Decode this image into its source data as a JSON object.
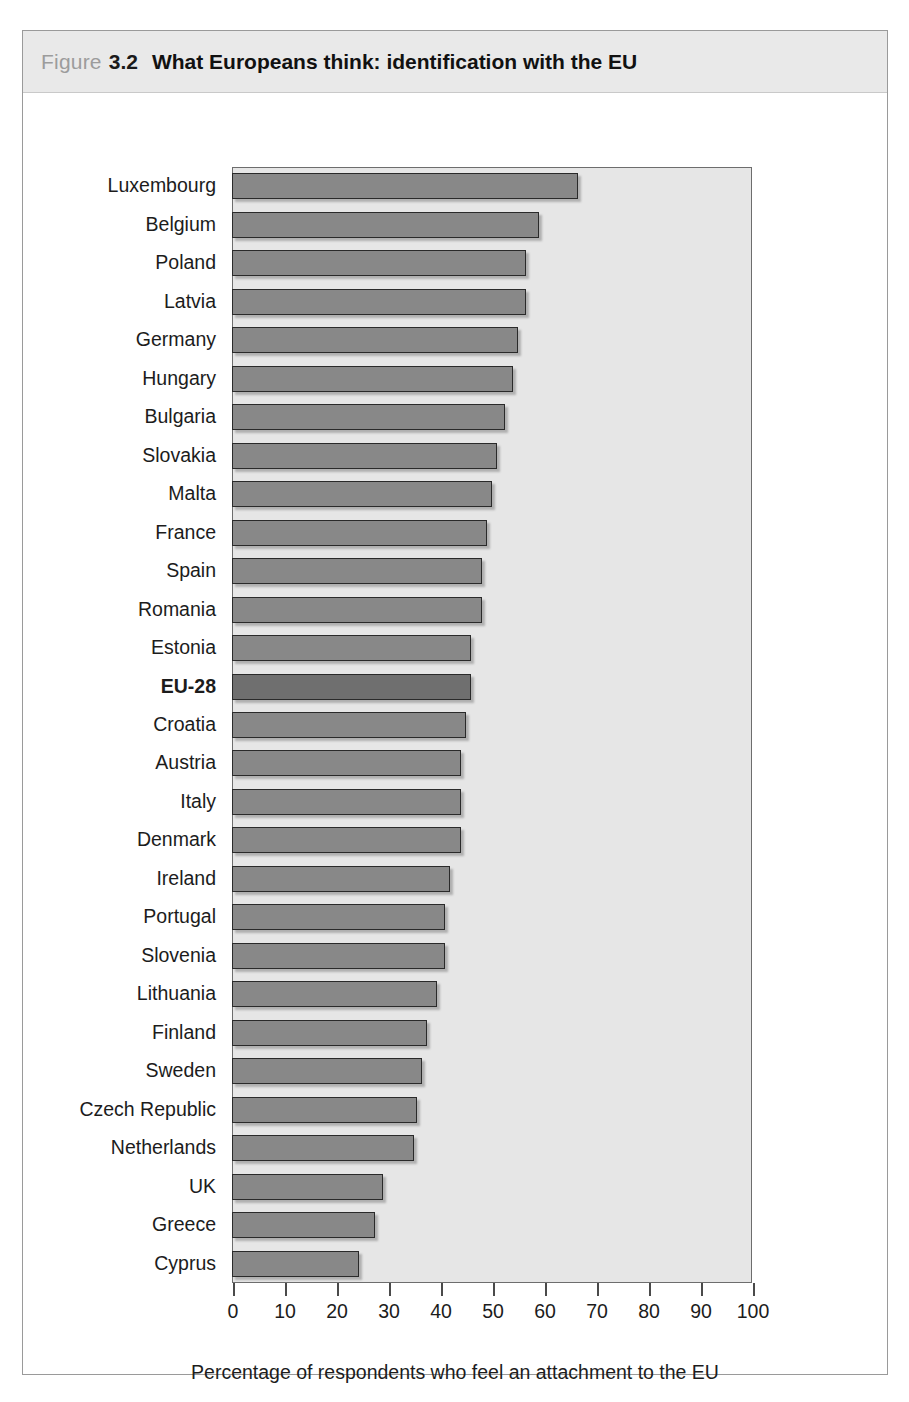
{
  "figure": {
    "label": "Figure",
    "number": "3.2",
    "title": "What Europeans think: identification with the EU"
  },
  "colors": {
    "caption_band": "#e9e9e9",
    "plot_background": "#e6e6e6",
    "bar_fill": "#888888",
    "bar_highlight_fill": "#6f6f6f",
    "bar_outline": "#2a2a2a",
    "frame_border": "#9a9a9a",
    "text": "#1c1c1c",
    "figure_label_grey": "#9c9c9c"
  },
  "chart_data": {
    "type": "bar",
    "orientation": "horizontal",
    "title": "What Europeans think: identification with the EU",
    "subtitle": "",
    "xlabel": "Percentage of respondents who feel an attachment to the EU",
    "ylabel": "",
    "xlim": [
      0,
      100
    ],
    "xticks": [
      0,
      10,
      20,
      30,
      40,
      50,
      60,
      70,
      80,
      90,
      100
    ],
    "xtick_labels": [
      "0",
      "10",
      "20",
      "30",
      "40",
      "50",
      "60",
      "70",
      "80",
      "90",
      "100"
    ],
    "grid": false,
    "legend": null,
    "highlight_category": "EU-28",
    "categories": [
      "Luxembourg",
      "Belgium",
      "Poland",
      "Latvia",
      "Germany",
      "Hungary",
      "Bulgaria",
      "Slovakia",
      "Malta",
      "France",
      "Spain",
      "Romania",
      "Estonia",
      "EU-28",
      "Croatia",
      "Austria",
      "Italy",
      "Denmark",
      "Ireland",
      "Portugal",
      "Slovenia",
      "Lithuania",
      "Finland",
      "Sweden",
      "Czech Republic",
      "Netherlands",
      "UK",
      "Greece",
      "Cyprus"
    ],
    "values": [
      66.5,
      59,
      56.5,
      56.5,
      55,
      54,
      52.5,
      51,
      50,
      49,
      48,
      48,
      46,
      46,
      45,
      44,
      44,
      44,
      42,
      41,
      41,
      39.5,
      37.5,
      36.5,
      35.5,
      35,
      29,
      27.5,
      24.5
    ]
  },
  "axis_title": "Percentage of respondents who feel an attachment to the EU"
}
